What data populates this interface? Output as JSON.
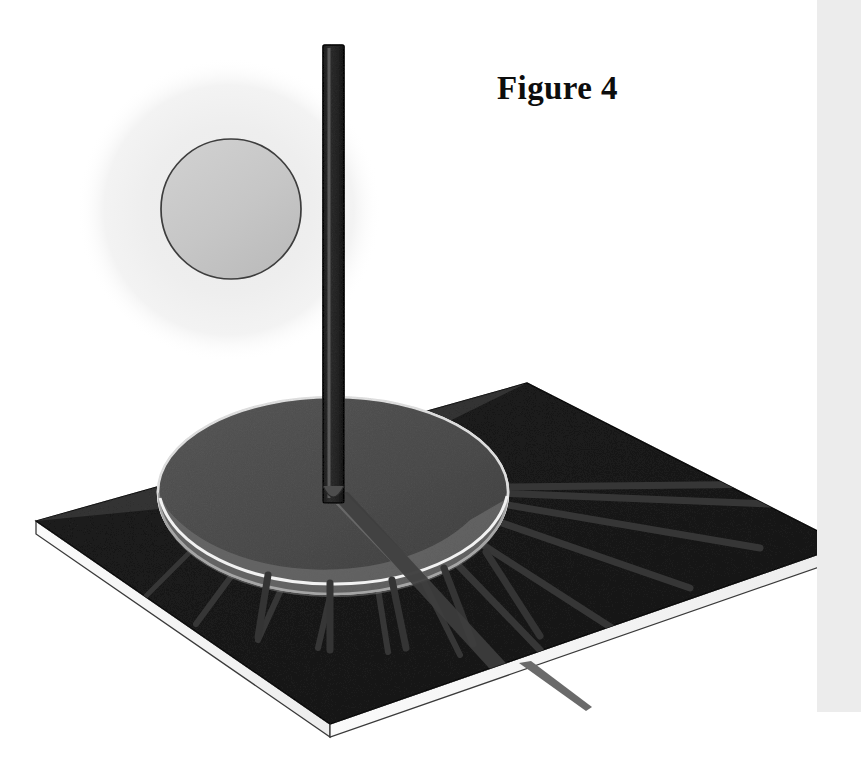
{
  "figure": {
    "title": "Figure 4",
    "kind": "sundial-diagram",
    "caption_position": "top-right",
    "background_color": "#ffffff"
  },
  "colors": {
    "page_background": "#ffffff",
    "scan_edge_band": "#ececec",
    "sun_glow": "#f0f0f0",
    "sun_disc_fill": "#c9c9c9",
    "sun_disc_outline": "#3a3a3a",
    "pole_face_light": "#6e6e6e",
    "pole_face_dark": "#4e4e4e",
    "pole_outline": "#2b2b2b",
    "plate_top_dark": "#4f4f4f",
    "plate_top_mid": "#585858",
    "plate_edge_white": "#f6f6f6",
    "plate_edge_line": "#2f2f2f",
    "dial_disc_light": "#8d8d8d",
    "dial_disc_shaded": "#7a7a7a",
    "dial_disc_outline": "#efefef",
    "hour_line": "#3b3b3b",
    "tick_mark": "#353535",
    "gnomon_shadow": "#3c3c3c",
    "title_text": "#0d0d0d"
  },
  "sun": {
    "name": "sun",
    "glow_center_x": 229,
    "glow_center_y": 210,
    "glow_radius": 150,
    "disc_center_x": 231,
    "disc_center_y": 209,
    "disc_radius": 70
  },
  "gnomon": {
    "name": "vertical-pole",
    "top_x": 323,
    "top_y": 45,
    "width": 21,
    "base_y": 500,
    "label": "gnomon"
  },
  "base_plate": {
    "name": "dial-base-plate",
    "corner_left_x": 36,
    "corner_left_y": 521,
    "corner_top_x": 527,
    "corner_top_y": 383,
    "corner_right_x": 845,
    "corner_right_y": 545,
    "corner_bottom_x": 330,
    "corner_bottom_y": 724,
    "thickness": 13
  },
  "dial_disc": {
    "name": "semicircular-dial-face",
    "center_x": 333,
    "center_y": 492,
    "radius_x": 175,
    "radius_y": 95,
    "note": "light gray half-disc inscribed on the plate"
  },
  "hour_lines": {
    "name": "hour-lines",
    "count": 12,
    "origin_x": 333,
    "origin_y": 494,
    "description": "radiating engraved hour lines from the gnomon foot"
  },
  "tick_marks": {
    "name": "rim-tick-marks",
    "count": 5,
    "description": "short radial ticks outside the lower rim of the dial disc"
  },
  "shadow": {
    "name": "gnomon-shadow",
    "description": "cast shadow of the pole running down-right across the plate and past its edge",
    "tip_x": 592,
    "tip_y": 706
  }
}
